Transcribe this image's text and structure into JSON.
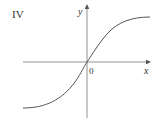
{
  "panel_label": "IV",
  "axes": {
    "x_label": "x",
    "y_label": "y",
    "origin_label": "0"
  },
  "curve": {
    "description": "increasing S-shaped (sigmoid-like) curve passing through origin, approaching horizontal asymptotes on left and right",
    "color": "#555555"
  },
  "colors": {
    "axis": "#666666",
    "text": "#333333",
    "background": "#ffffff"
  }
}
